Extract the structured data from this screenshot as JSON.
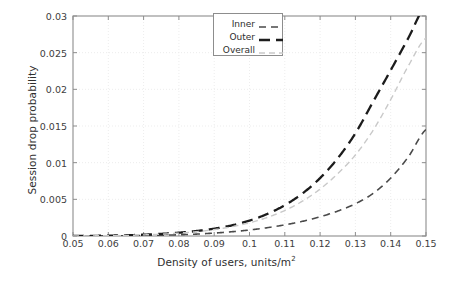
{
  "chart_data": {
    "type": "line",
    "title": "",
    "xlabel": "Density of users, units/m",
    "xlabel_sup": "2",
    "ylabel": "Session drop probability",
    "xlim": [
      0.05,
      0.15
    ],
    "ylim": [
      0,
      0.03
    ],
    "xticks": [
      "0.05",
      "0.06",
      "0.07",
      "0.08",
      "0.09",
      "0.1",
      "0.11",
      "0.12",
      "0.13",
      "0.14",
      "0.15"
    ],
    "xtick_values": [
      0.05,
      0.06,
      0.07,
      0.08,
      0.09,
      0.1,
      0.11,
      0.12,
      0.13,
      0.14,
      0.15
    ],
    "yticks": [
      "0",
      "0.005",
      "0.01",
      "0.015",
      "0.02",
      "0.025",
      "0.03"
    ],
    "ytick_values": [
      0,
      0.005,
      0.01,
      0.015,
      0.02,
      0.025,
      0.03
    ],
    "grid": true,
    "legend_position": "top-center",
    "x": [
      0.05,
      0.055,
      0.06,
      0.065,
      0.07,
      0.075,
      0.08,
      0.085,
      0.09,
      0.095,
      0.1,
      0.105,
      0.11,
      0.115,
      0.12,
      0.125,
      0.13,
      0.135,
      0.14,
      0.145,
      0.15
    ],
    "series": [
      {
        "name": "Inner",
        "color": "#4a4a4a",
        "dash": "medium-dash",
        "width": 1.6,
        "values": [
          0.0,
          1e-05,
          2e-05,
          4e-05,
          7e-05,
          0.00011,
          0.00017,
          0.00026,
          0.0004,
          0.00058,
          0.00082,
          0.00113,
          0.00152,
          0.002,
          0.00262,
          0.0034,
          0.0044,
          0.0058,
          0.0079,
          0.0108,
          0.0145
        ]
      },
      {
        "name": "Outer",
        "color": "#1c1c1c",
        "dash": "long-dash",
        "width": 2.3,
        "values": [
          0.0,
          2e-05,
          5e-05,
          0.0001,
          0.00018,
          0.00029,
          0.00045,
          0.00068,
          0.001,
          0.00145,
          0.0021,
          0.003,
          0.0042,
          0.0058,
          0.0079,
          0.0106,
          0.014,
          0.0183,
          0.0226,
          0.027,
          0.0315
        ]
      },
      {
        "name": "Overall",
        "color": "#c9c9c9",
        "dash": "thin-dash",
        "width": 1.4,
        "values": [
          0.0,
          2e-05,
          4e-05,
          8e-05,
          0.00015,
          0.00025,
          0.00039,
          0.00059,
          0.00087,
          0.00126,
          0.0018,
          0.00252,
          0.00348,
          0.00475,
          0.0064,
          0.0085,
          0.01105,
          0.0144,
          0.0186,
          0.0232,
          0.027
        ]
      }
    ]
  },
  "legend": {
    "items": [
      {
        "label": "Inner"
      },
      {
        "label": "Outer"
      },
      {
        "label": "Overall"
      }
    ]
  }
}
